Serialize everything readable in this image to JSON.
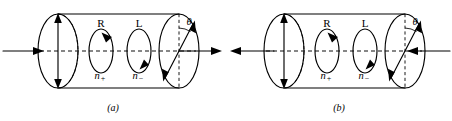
{
  "figure": {
    "title_visible": false,
    "panels": [
      {
        "id": "a",
        "caption": "(a)",
        "labels": {
          "right_circ": "R",
          "left_circ": "L",
          "index_plus": "n",
          "index_plus_sub": "+",
          "index_minus": "n",
          "index_minus_sub": "−",
          "angle": "θ"
        },
        "beam_in_direction": "right",
        "beam_out_direction": "right"
      },
      {
        "id": "b",
        "caption": "(b)",
        "labels": {
          "right_circ": "R",
          "left_circ": "L",
          "index_plus": "n",
          "index_plus_sub": "+",
          "index_minus": "n",
          "index_minus_sub": "−",
          "angle": "θ"
        },
        "beam_in_direction": "left",
        "beam_out_direction": "left"
      }
    ],
    "colors": {
      "ink": "#000000",
      "background": "#ffffff"
    }
  }
}
